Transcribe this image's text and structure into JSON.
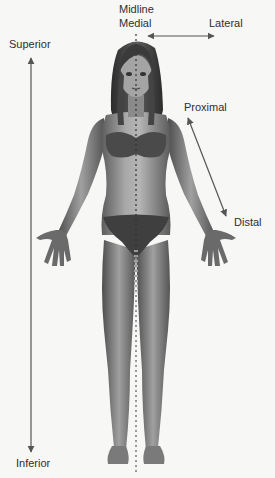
{
  "diagram": {
    "type": "anatomical-directional-terms",
    "labels": {
      "midline": "Midline",
      "medial": "Medial",
      "lateral": "Lateral",
      "superior": "Superior",
      "inferior": "Inferior",
      "proximal": "Proximal",
      "distal": "Distal"
    },
    "arrows": [
      {
        "name": "medial-lateral",
        "style": "double-headed",
        "orientation": "horizontal"
      },
      {
        "name": "superior-inferior",
        "style": "double-headed",
        "orientation": "vertical"
      },
      {
        "name": "proximal-distal",
        "style": "double-headed",
        "orientation": "diagonal"
      }
    ],
    "midline_style": "dashed vertical line through body center",
    "colors": {
      "background": "#f7f7f5",
      "arrow": "#555555",
      "text": "#2f2f2f",
      "skin_light": "#b8b8b8",
      "skin_dark": "#5a5a5a",
      "hair": "#3a3a3a"
    }
  }
}
